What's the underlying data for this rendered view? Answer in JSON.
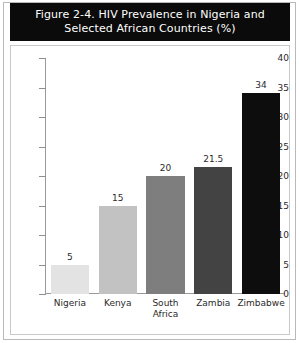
{
  "figure": {
    "title_line1": "Figure 2-4. HIV Prevalence in Nigeria and",
    "title_line2": "Selected African Countries (%)",
    "title_banner_color": "#0b0b0b",
    "title_text_color": "#ffffff",
    "background_color": "#ffffff",
    "frame_color": "#b9b9b9"
  },
  "chart_data": {
    "type": "bar",
    "title": "Figure 2-4. HIV Prevalence in Nigeria and Selected African Countries (%)",
    "categories": [
      "Nigeria",
      "Kenya",
      "South Africa",
      "Zambia",
      "Zimbabwe"
    ],
    "category_lines": [
      [
        "Nigeria"
      ],
      [
        "Kenya"
      ],
      [
        "South",
        "Africa"
      ],
      [
        "Zambia"
      ],
      [
        "Zimbabwe"
      ]
    ],
    "values": [
      5,
      15,
      20,
      21.5,
      34
    ],
    "value_labels": [
      "5",
      "15",
      "20",
      "21.5",
      "34"
    ],
    "bar_colors": [
      "#e3e3e3",
      "#c2c2c2",
      "#7e7e7e",
      "#434343",
      "#0d0d0d"
    ],
    "xlabel": "",
    "ylabel": "",
    "ylim": [
      0,
      40
    ],
    "yticks": [
      0,
      5,
      10,
      15,
      20,
      25,
      30,
      35,
      40
    ],
    "ytick_labels": [
      "0",
      "5",
      "10",
      "15",
      "20",
      "25",
      "30",
      "35",
      "40"
    ],
    "grid": false,
    "legend": false
  }
}
